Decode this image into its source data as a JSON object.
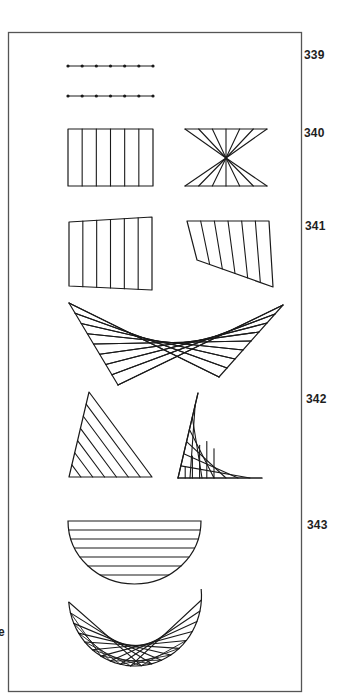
{
  "page": {
    "background": "#ffffff",
    "ink_color": "#1a1a1a",
    "frame_color": "#555555"
  },
  "labels": [
    {
      "id": "339",
      "text": "339",
      "x": 304,
      "y": 49
    },
    {
      "id": "340",
      "text": "340",
      "x": 304,
      "y": 127
    },
    {
      "id": "341",
      "text": "341",
      "x": 305,
      "y": 220
    },
    {
      "id": "342",
      "text": "342",
      "x": 306,
      "y": 393
    },
    {
      "id": "343",
      "text": "343",
      "x": 307,
      "y": 519
    }
  ],
  "edge_fragment": {
    "text": "e",
    "x": 0,
    "y": 626
  },
  "figures": {
    "fig339": {
      "description": "Two dotted line segments with 7 evenly spaced points each",
      "rows": [
        {
          "y": 66,
          "x1": 68,
          "x2": 153,
          "points": 7
        },
        {
          "y": 96,
          "x1": 68,
          "x2": 153,
          "points": 7
        }
      ]
    },
    "fig340": {
      "rectangle": {
        "x": 68,
        "y": 129,
        "w": 85,
        "h": 57,
        "divisions": 6
      },
      "hourglass": {
        "top_y": 129,
        "bottom_y": 186,
        "x1": 185,
        "x2": 267,
        "center": [
          226,
          158
        ],
        "points": 7
      }
    },
    "fig341": {
      "quad_a": {
        "corners": [
          [
            69,
            222
          ],
          [
            152,
            217
          ],
          [
            152,
            290
          ],
          [
            69,
            286
          ]
        ],
        "divisions": 6
      },
      "quad_b": {
        "corners": [
          [
            187,
            221
          ],
          [
            269,
            221
          ],
          [
            273,
            287
          ],
          [
            197,
            260
          ]
        ],
        "divisions": 6
      }
    },
    "fig342": {
      "butterfly": {
        "left_top": [
          69,
          303
        ],
        "left_bottom": [
          118,
          385
        ],
        "right_top": [
          283,
          305
        ],
        "right_bottom": [
          219,
          377
        ],
        "lines": 8
      },
      "triangle_parallel": {
        "apex": [
          89,
          392
        ],
        "base_left": [
          69,
          477
        ],
        "base_right": [
          152,
          477
        ],
        "lines": 7
      },
      "triangle_envelope": {
        "apex": [
          198,
          393
        ],
        "base_left": [
          178,
          478
        ],
        "base_right": [
          262,
          478
        ],
        "lines": 7
      }
    },
    "fig343": {
      "half_ellipse": {
        "cx": 134.5,
        "top_y": 521,
        "rx": 66.5,
        "ry": 63,
        "chords": 7
      },
      "crescent": {
        "cx": 135,
        "cy": 603,
        "rx": 66.5,
        "ry": 63,
        "left_top": [
          69,
          602
        ],
        "right_top": [
          201,
          589
        ],
        "lines": 10
      }
    }
  }
}
